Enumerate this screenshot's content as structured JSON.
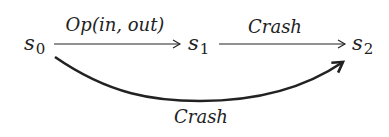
{
  "diagram": {
    "type": "state-transition",
    "nodes": [
      {
        "id": "s0",
        "base": "s",
        "subscript": "0"
      },
      {
        "id": "s1",
        "base": "s",
        "subscript": "1"
      },
      {
        "id": "s2",
        "base": "s",
        "subscript": "2"
      }
    ],
    "edges": [
      {
        "from": "s0",
        "to": "s1",
        "label": "Op(in, out)",
        "style": "thin-straight"
      },
      {
        "from": "s1",
        "to": "s2",
        "label": "Crash",
        "style": "thin-straight"
      },
      {
        "from": "s0",
        "to": "s2",
        "label": "Crash",
        "style": "thick-curved"
      }
    ],
    "colors": {
      "ink": "#222222",
      "background": "#ffffff"
    }
  }
}
